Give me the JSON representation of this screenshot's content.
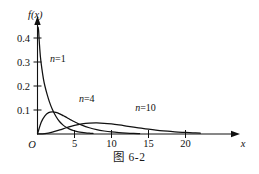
{
  "figure": {
    "caption": "图 6-2",
    "background_color": "#ffffff",
    "line_color": "#111111"
  },
  "chart_data": {
    "type": "line",
    "title": "",
    "subtitle": "",
    "xlabel": "x",
    "ylabel": "f(x)",
    "xlim": [
      0,
      22.5
    ],
    "ylim": [
      0,
      0.45
    ],
    "grid": false,
    "legend_position": "inline-annotations",
    "x_ticks": [
      5,
      10,
      15,
      20
    ],
    "x_tick_labels": [
      "5",
      "10",
      "15",
      "20"
    ],
    "y_ticks": [
      0.1,
      0.2,
      0.3,
      0.4
    ],
    "y_tick_labels": [
      "0.1",
      "0.2",
      "0.3",
      "0.4"
    ],
    "origin_label": "O",
    "series": [
      {
        "name": "n=1",
        "label": "n=1",
        "label_n": "n",
        "label_eq": "=1",
        "annotation_x": 1.7,
        "annotation_y": 0.3,
        "x": [
          0.08,
          0.15,
          0.25,
          0.4,
          0.6,
          0.8,
          1.0,
          1.3,
          1.6,
          2.0,
          2.5,
          3.0,
          3.5,
          4.0,
          4.5,
          5.0,
          5.5,
          6.0,
          6.5,
          7.0,
          7.5
        ],
        "y": [
          0.445,
          0.43,
          0.38,
          0.32,
          0.27,
          0.23,
          0.2,
          0.165,
          0.135,
          0.103,
          0.073,
          0.051,
          0.036,
          0.026,
          0.018,
          0.013,
          0.0093,
          0.0067,
          0.0048,
          0.0035,
          0.0025
        ]
      },
      {
        "name": "n=4",
        "label": "n=4",
        "label_n": "n",
        "label_eq": "=4",
        "annotation_x": 5.6,
        "annotation_y": 0.135,
        "x": [
          0.0,
          0.5,
          1.0,
          1.5,
          2.0,
          2.5,
          3.0,
          3.5,
          4.0,
          4.5,
          5.0,
          6.0,
          7.0,
          8.0,
          9.0,
          10.0,
          11.0,
          12.0,
          13.0,
          13.8
        ],
        "y": [
          0.0,
          0.049,
          0.076,
          0.089,
          0.092,
          0.09,
          0.084,
          0.076,
          0.068,
          0.059,
          0.051,
          0.037,
          0.026,
          0.018,
          0.0125,
          0.0084,
          0.0056,
          0.0037,
          0.0024,
          0.0018
        ]
      },
      {
        "name": "n=10",
        "label": "n=10",
        "label_n": "n",
        "label_eq": "=10",
        "annotation_x": 13.2,
        "annotation_y": 0.095,
        "x": [
          0.0,
          1.0,
          2.0,
          3.0,
          4.0,
          5.0,
          6.0,
          7.0,
          8.0,
          9.0,
          10.0,
          11.0,
          12.0,
          13.0,
          14.0,
          15.0,
          16.0,
          17.0,
          18.0,
          19.0,
          20.0,
          21.0,
          22.0
        ],
        "y": [
          0.0,
          0.0016,
          0.0077,
          0.017,
          0.0271,
          0.0361,
          0.042,
          0.0452,
          0.046,
          0.0446,
          0.0417,
          0.0378,
          0.0333,
          0.0287,
          0.0242,
          0.0201,
          0.0164,
          0.0132,
          0.0105,
          0.0082,
          0.0063,
          0.0048,
          0.0036
        ]
      }
    ],
    "note": "Chi-square probability density curves for degrees of freedom n=1, n=4, n=10; n=4 and n=10 peaks visually scaled in the source figure"
  }
}
